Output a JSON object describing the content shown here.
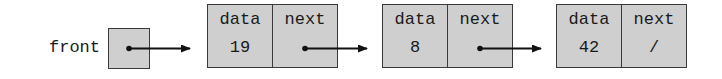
{
  "diagram": {
    "front": {
      "label": "front"
    },
    "nodes": [
      {
        "data_header": "data",
        "next_header": "next",
        "data_value": "19",
        "next_value": ""
      },
      {
        "data_header": "data",
        "next_header": "next",
        "data_value": "8",
        "next_value": ""
      },
      {
        "data_header": "data",
        "next_header": "next",
        "data_value": "42",
        "next_value": "/"
      }
    ],
    "colors": {
      "box_fill": "#cfcfcf",
      "border": "#3a3a3a",
      "arrow": "#111111"
    }
  }
}
